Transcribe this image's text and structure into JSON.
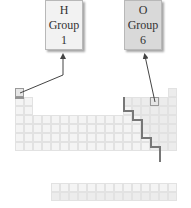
{
  "callouts": [
    {
      "symbol": "H",
      "label": "Group",
      "group": "1"
    },
    {
      "symbol": "O",
      "label": "Group",
      "group": "6"
    }
  ],
  "periodic_table": {
    "columns": 18,
    "rows": 7,
    "highlighted": [
      {
        "symbol": "H",
        "row": 1,
        "col": 1
      },
      {
        "symbol": "O",
        "row": 2,
        "col": 16
      }
    ],
    "staircase_line": true,
    "f_block_rows": 2
  },
  "colors": {
    "metal": "#f4f4f4",
    "nonmetal": "#ececec",
    "border": "#e2e2e2",
    "staircase": "#777777",
    "arrow": "#444444"
  }
}
